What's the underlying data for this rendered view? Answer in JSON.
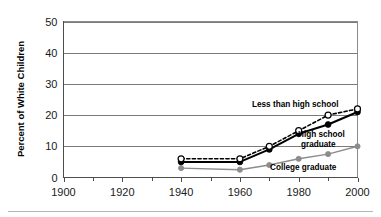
{
  "chart_data": {
    "type": "line",
    "title": "",
    "subtitle": "",
    "xlabel": "",
    "ylabel": "Percent of White Children",
    "xlim": [
      1900,
      2000
    ],
    "ylim": [
      0,
      50
    ],
    "grid": "horizontal",
    "legend_position": "inline-annotations",
    "x_ticks_major": [
      1900,
      1920,
      1940,
      1960,
      1980,
      2000
    ],
    "x_ticks_minor": [
      1910,
      1930,
      1950,
      1970,
      1990
    ],
    "y_ticks": [
      0,
      10,
      20,
      30,
      40,
      50
    ],
    "x": [
      1940,
      1960,
      1970,
      1980,
      1990,
      2000
    ],
    "series": [
      {
        "name": "Less than high school",
        "values": [
          6,
          6,
          10,
          15,
          20,
          22
        ],
        "line_style": "dashed",
        "marker": "open-circle",
        "color": "#000000"
      },
      {
        "name": "High school graduate",
        "values": [
          5,
          5,
          9,
          14,
          17,
          21
        ],
        "line_style": "solid",
        "marker": "filled-circle",
        "color": "#000000"
      },
      {
        "name": "College graduate",
        "values": [
          3,
          2.5,
          4,
          6,
          7.5,
          10
        ],
        "line_style": "solid",
        "marker": "filled-circle",
        "color": "#8c8c8c"
      }
    ],
    "annotations": [
      {
        "text": "Less than high school",
        "x": 1968,
        "y": 24.5
      },
      {
        "text": "High school",
        "x": 1982,
        "y": 13.0
      },
      {
        "text": "graduate",
        "x": 1983,
        "y": 11.2
      },
      {
        "text": "College graduate",
        "x": 1975,
        "y": 3.2
      }
    ]
  },
  "axes": {
    "y_label": "Percent of White Children",
    "y_tick_labels": [
      "0",
      "10",
      "20",
      "30",
      "40",
      "50"
    ],
    "x_tick_labels": [
      "1900",
      "1920",
      "1940",
      "1960",
      "1980",
      "2000"
    ]
  },
  "annotation_labels": {
    "less_than_high_school": "Less than high school",
    "high_school_line1": "High school",
    "high_school_line2": "graduate",
    "college_graduate": "College graduate"
  },
  "colors": {
    "series_dark": "#000000",
    "series_gray": "#8c8c8c",
    "gridline": "#7a7a7a",
    "axis": "#4d4d4d",
    "background": "#ffffff"
  }
}
